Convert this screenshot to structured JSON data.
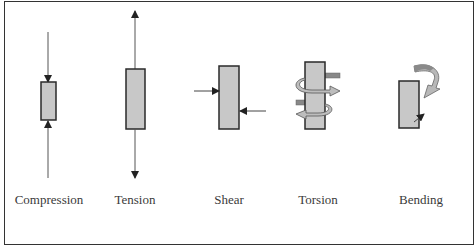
{
  "diagram": {
    "colors": {
      "member_fill": "#c8c8c8",
      "member_stroke": "#2a2a2a",
      "arrow": "#333333",
      "curved_arrow_fill": "#b8b8b8",
      "curved_arrow_dark": "#888888",
      "frame": "#333333"
    },
    "panels": [
      {
        "id": "compression",
        "label": "Compression",
        "label_x": 49,
        "forces": "two axial arrows pointing toward the member"
      },
      {
        "id": "tension",
        "label": "Tension",
        "label_x": 135,
        "forces": "two axial arrows pointing away from the member"
      },
      {
        "id": "shear",
        "label": "Shear",
        "label_x": 229,
        "forces": "two opposing lateral arrows at offset heights"
      },
      {
        "id": "torsion",
        "label": "Torsion",
        "label_x": 318,
        "forces": "two opposing curved twisting arrows"
      },
      {
        "id": "bending",
        "label": "Bending",
        "label_x": 421,
        "forces": "curved moment arrow at top, small arrow at bottom"
      }
    ]
  }
}
